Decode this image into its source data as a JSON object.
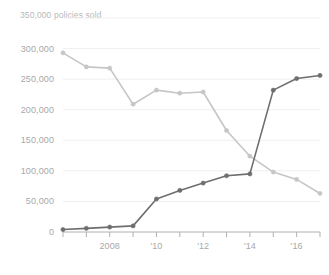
{
  "chart_data": {
    "type": "line",
    "title": "",
    "top_label": "350,000 policies sold",
    "xlabel": "",
    "ylabel": "",
    "x": [
      2006,
      2007,
      2008,
      2009,
      2010,
      2011,
      2012,
      2013,
      2014,
      2015,
      2016,
      2017
    ],
    "xlim": [
      2006,
      2017
    ],
    "ylim": [
      0,
      350000
    ],
    "yticks": [
      0,
      50000,
      100000,
      150000,
      200000,
      250000,
      300000,
      350000
    ],
    "ytick_labels": [
      "0",
      "50,000",
      "100,000",
      "150,000",
      "200,000",
      "250,000",
      "300,000",
      "350,000"
    ],
    "xticks": [
      2006,
      2007,
      2008,
      2009,
      2010,
      2011,
      2012,
      2013,
      2014,
      2015,
      2016,
      2017
    ],
    "xtick_labels": [
      "",
      "",
      "2008",
      "",
      "'10",
      "",
      "'12",
      "",
      "'14",
      "",
      "'16",
      ""
    ],
    "grid": true,
    "legend_position": "none",
    "series": [
      {
        "name": "declining-series",
        "color": "#c6c6c6",
        "marker": "circle",
        "values": [
          293000,
          270000,
          268000,
          209000,
          232000,
          227000,
          229000,
          166000,
          124000,
          98000,
          86000,
          63000
        ]
      },
      {
        "name": "rising-series",
        "color": "#6e6e6e",
        "marker": "circle",
        "values": [
          4000,
          6000,
          8000,
          10000,
          54000,
          68000,
          80000,
          92000,
          95000,
          232000,
          251000,
          256000
        ]
      }
    ]
  },
  "colors": {
    "axis": "#b0b0b0",
    "grid": "#efefef",
    "tick_text": "#a8a8a8",
    "top_label_text": "#b9b9b9",
    "background": "#ffffff"
  }
}
